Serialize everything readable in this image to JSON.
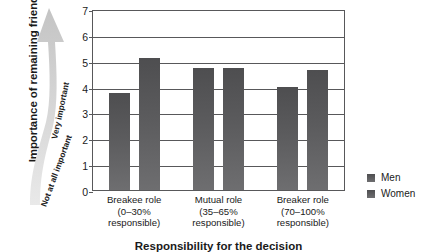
{
  "chart_data": {
    "type": "bar",
    "title": "",
    "xlabel": "Responsibility for the decision",
    "ylabel": "Importance of remaining friends",
    "categories": [
      "Breakee role\n(0–30%\nresponsible)",
      "Mutual role\n(35–65%\nresponsible)",
      "Breaker role\n(70–100%\nresponsible)"
    ],
    "category_lines": [
      [
        "Breakee role",
        "(0–30%",
        "responsible)"
      ],
      [
        "Mutual role",
        "(35–65%",
        "responsible)"
      ],
      [
        "Breaker role",
        "(70–100%",
        "responsible)"
      ]
    ],
    "series": [
      {
        "name": "Men",
        "values": [
          3.75,
          4.7,
          4.0
        ],
        "color": "#5b5b5d"
      },
      {
        "name": "Women",
        "values": [
          5.1,
          4.7,
          4.65
        ],
        "color": "#5b5b5d"
      }
    ],
    "ylim": [
      0,
      7
    ],
    "yticks": [
      0,
      1,
      2,
      3,
      4,
      5,
      6,
      7
    ],
    "ytick_labels": [
      "0",
      "1",
      "2",
      "3",
      "4",
      "5",
      "6",
      "7"
    ],
    "grid": true,
    "legend_position": "right"
  },
  "axis_annotation": {
    "arrow_top_label": "Very important",
    "arrow_bottom_label": "Not at all important"
  },
  "legend": {
    "items": [
      {
        "label": "Men"
      },
      {
        "label": "Women"
      }
    ]
  },
  "colors": {
    "bar": "#5b5b5d",
    "axis": "#58585a",
    "text": "#1a1a1a",
    "arrow": "#d2d2d2"
  }
}
